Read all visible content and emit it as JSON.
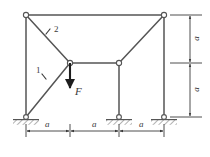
{
  "figure": {
    "type": "structural-truss-frame-diagram",
    "line_color": "#555555",
    "label_color": "#3a3a3a",
    "background": "#ffffff"
  },
  "labels": {
    "member_1": "1",
    "member_2": "2",
    "force": "F",
    "dim_bottom_left": "a",
    "dim_bottom_mid": "a",
    "dim_bottom_right": "a",
    "dim_right_upper": "a",
    "dim_right_lower": "a"
  },
  "joints": [
    {
      "name": "top-left-joint",
      "x": 26,
      "y": 15
    },
    {
      "name": "top-right-joint",
      "x": 164,
      "y": 15
    },
    {
      "name": "center-joint",
      "x": 70,
      "y": 63
    },
    {
      "name": "mid-right-joint",
      "x": 119,
      "y": 63
    }
  ],
  "supports": [
    {
      "name": "left-support",
      "x": 26,
      "y": 117
    },
    {
      "name": "middle-support",
      "x": 119,
      "y": 117
    },
    {
      "name": "right-support",
      "x": 164,
      "y": 117
    }
  ],
  "load": {
    "name": "force-F",
    "from_x": 70,
    "from_y": 63,
    "to_x": 70,
    "to_y": 92,
    "direction": "down"
  },
  "dimensions": {
    "bottom": {
      "y": 131,
      "segments": [
        {
          "x1": 26,
          "x2": 70
        },
        {
          "x1": 70,
          "x2": 119
        },
        {
          "x1": 119,
          "x2": 164
        }
      ]
    },
    "right": {
      "x": 190,
      "segments": [
        {
          "y1": 15,
          "y2": 63
        },
        {
          "y1": 63,
          "y2": 117
        }
      ]
    }
  }
}
